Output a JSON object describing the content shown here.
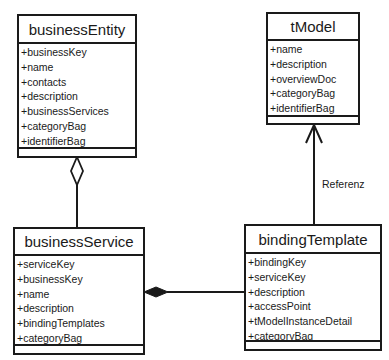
{
  "classes": {
    "businessEntity": {
      "name": "businessEntity",
      "attributes": [
        "+businessKey",
        "+name",
        "+contacts",
        "+description",
        "+businessServices",
        "+categoryBag",
        "+identifierBag"
      ]
    },
    "tModel": {
      "name": "tModel",
      "attributes": [
        "+name",
        "+description",
        "+overviewDoc",
        "+categoryBag",
        "+identifierBag"
      ]
    },
    "businessService": {
      "name": "businessService",
      "attributes": [
        "+serviceKey",
        "+businessKey",
        "+name",
        "+description",
        "+bindingTemplates",
        "+categoryBag"
      ]
    },
    "bindingTemplate": {
      "name": "bindingTemplate",
      "attributes": [
        "+bindingKey",
        "+serviceKey",
        "+description",
        "+accessPoint",
        "+tModelInstanceDetail",
        "+categoryBag"
      ]
    }
  },
  "relations": {
    "reference_label": "Referenz"
  }
}
